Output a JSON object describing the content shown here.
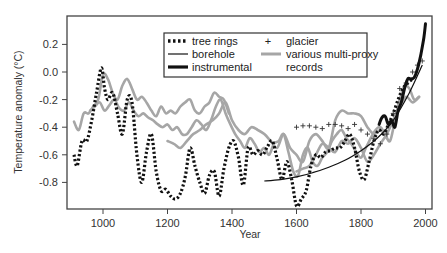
{
  "chart_data": {
    "type": "line",
    "title": "",
    "xlabel": "Year",
    "ylabel": "Temperature anomaly (°C)",
    "xlim": [
      890,
      2025
    ],
    "ylim": [
      -0.98,
      0.38
    ],
    "x_ticks": [
      1000,
      1200,
      1400,
      1600,
      1800,
      2000
    ],
    "x_tick_labels": [
      "1000",
      "1200",
      "1400",
      "1600",
      "1800",
      "2000"
    ],
    "y_ticks": [
      0.2,
      0.0,
      -0.2,
      -0.4,
      -0.6,
      -0.8
    ],
    "y_tick_labels": [
      "0.2",
      "0.0",
      "-0.2",
      "-0.4",
      "-0.6",
      "-0.8"
    ],
    "grid": false,
    "legend_position": "upper center",
    "legend": [
      {
        "label": "tree rings",
        "style": "dotted",
        "color": "#111111"
      },
      {
        "label": "borehole",
        "style": "thin-solid",
        "color": "#111111"
      },
      {
        "label": "instrumental",
        "style": "thick-solid",
        "color": "#111111"
      },
      {
        "label": "glacier",
        "style": "plus-marker",
        "color": "#333333"
      },
      {
        "label": "various multi-proxy records",
        "style": "thick-solid",
        "color": "#a6a6a6"
      }
    ],
    "series": [
      {
        "name": "tree rings",
        "x": [
          910,
          920,
          935,
          950,
          965,
          980,
          995,
          1005,
          1015,
          1030,
          1045,
          1060,
          1075,
          1090,
          1105,
          1120,
          1135,
          1150,
          1165,
          1180,
          1195,
          1210,
          1225,
          1240,
          1255,
          1270,
          1285,
          1300,
          1315,
          1330,
          1345,
          1360,
          1375,
          1390,
          1405,
          1420,
          1435,
          1450,
          1465,
          1480,
          1495,
          1510,
          1525,
          1540,
          1555,
          1570,
          1585,
          1600,
          1615,
          1630,
          1645,
          1660,
          1675,
          1690,
          1705,
          1720,
          1735,
          1750,
          1765,
          1780,
          1795,
          1810,
          1825,
          1840,
          1855,
          1870,
          1885,
          1900,
          1915,
          1930,
          1945,
          1960
        ],
        "y": [
          -0.6,
          -0.68,
          -0.5,
          -0.5,
          -0.35,
          -0.15,
          0.03,
          -0.12,
          -0.2,
          -0.15,
          -0.3,
          -0.45,
          -0.2,
          -0.22,
          -0.6,
          -0.8,
          -0.58,
          -0.45,
          -0.72,
          -0.86,
          -0.85,
          -0.9,
          -0.92,
          -0.88,
          -0.76,
          -0.55,
          -0.68,
          -0.8,
          -0.88,
          -0.75,
          -0.72,
          -0.9,
          -0.7,
          -0.55,
          -0.5,
          -0.62,
          -0.82,
          -0.55,
          -0.6,
          -0.57,
          -0.6,
          -0.54,
          -0.5,
          -0.63,
          -0.78,
          -0.65,
          -0.78,
          -0.97,
          -0.92,
          -0.86,
          -0.68,
          -0.6,
          -0.62,
          -0.58,
          -0.57,
          -0.55,
          -0.55,
          -0.5,
          -0.45,
          -0.55,
          -0.72,
          -0.78,
          -0.65,
          -0.5,
          -0.42,
          -0.45,
          -0.38,
          -0.3,
          -0.2,
          -0.12,
          -0.08,
          -0.05
        ]
      },
      {
        "name": "borehole",
        "x": [
          1500,
          1550,
          1600,
          1650,
          1700,
          1750,
          1800,
          1850,
          1900,
          1950,
          1990
        ],
        "y": [
          -0.79,
          -0.78,
          -0.76,
          -0.73,
          -0.69,
          -0.64,
          -0.57,
          -0.48,
          -0.35,
          -0.15,
          0.05
        ]
      },
      {
        "name": "instrumental",
        "x": [
          1856,
          1865,
          1875,
          1885,
          1895,
          1905,
          1915,
          1925,
          1935,
          1945,
          1955,
          1965,
          1975,
          1985,
          1995,
          2000
        ],
        "y": [
          -0.38,
          -0.33,
          -0.32,
          -0.38,
          -0.35,
          -0.4,
          -0.28,
          -0.22,
          -0.12,
          -0.05,
          -0.05,
          -0.04,
          0.02,
          0.12,
          0.25,
          0.35
        ]
      },
      {
        "name": "glacier",
        "x": [
          1600,
          1620,
          1640,
          1660,
          1680,
          1700,
          1720,
          1740,
          1760,
          1780,
          1800,
          1820,
          1840,
          1860,
          1880,
          1900,
          1920,
          1940,
          1960,
          1975,
          1990
        ],
        "y": [
          -0.4,
          -0.39,
          -0.39,
          -0.4,
          -0.41,
          -0.38,
          -0.38,
          -0.39,
          -0.41,
          -0.38,
          -0.42,
          -0.45,
          -0.48,
          -0.52,
          -0.45,
          -0.3,
          -0.12,
          -0.08,
          0.0,
          0.05,
          0.08
        ]
      },
      {
        "name": "various multi-proxy records (A)",
        "x": [
          910,
          925,
          940,
          955,
          970,
          985,
          1000,
          1015,
          1030,
          1045,
          1060,
          1075,
          1090,
          1105,
          1120,
          1135,
          1150,
          1165,
          1180,
          1195,
          1210,
          1225,
          1240,
          1255,
          1270,
          1285,
          1300,
          1315,
          1330,
          1345,
          1360,
          1375,
          1390
        ],
        "y": [
          -0.36,
          -0.42,
          -0.3,
          -0.3,
          -0.25,
          -0.2,
          -0.02,
          -0.05,
          -0.15,
          -0.2,
          -0.1,
          -0.05,
          -0.12,
          -0.2,
          -0.18,
          -0.22,
          -0.28,
          -0.32,
          -0.25,
          -0.3,
          -0.28,
          -0.3,
          -0.25,
          -0.22,
          -0.2,
          -0.28,
          -0.3,
          -0.25,
          -0.22,
          -0.15,
          -0.18,
          -0.2,
          -0.3
        ]
      },
      {
        "name": "various multi-proxy records (B)",
        "x": [
          960,
          975,
          990,
          1005,
          1020,
          1035,
          1050,
          1065,
          1080,
          1095,
          1110,
          1125,
          1140,
          1155,
          1170,
          1185,
          1200,
          1215,
          1230,
          1245,
          1260,
          1275,
          1290,
          1305,
          1320,
          1335,
          1350,
          1365,
          1380,
          1395,
          1410,
          1425,
          1440,
          1455,
          1470,
          1485,
          1500,
          1515,
          1530,
          1545,
          1560,
          1575,
          1590,
          1605,
          1620,
          1635,
          1650,
          1665,
          1680,
          1695,
          1710,
          1725,
          1740,
          1755,
          1770,
          1785,
          1800,
          1815,
          1830,
          1845,
          1860,
          1875,
          1890,
          1905,
          1920,
          1935,
          1950,
          1965,
          1980
        ],
        "y": [
          -0.28,
          -0.25,
          -0.22,
          -0.28,
          -0.24,
          -0.2,
          -0.26,
          -0.28,
          -0.22,
          -0.28,
          -0.32,
          -0.3,
          -0.33,
          -0.35,
          -0.38,
          -0.4,
          -0.38,
          -0.42,
          -0.4,
          -0.45,
          -0.45,
          -0.4,
          -0.35,
          -0.38,
          -0.42,
          -0.35,
          -0.25,
          -0.2,
          -0.3,
          -0.38,
          -0.45,
          -0.5,
          -0.55,
          -0.48,
          -0.52,
          -0.58,
          -0.55,
          -0.6,
          -0.52,
          -0.5,
          -0.45,
          -0.58,
          -0.72,
          -0.75,
          -0.6,
          -0.55,
          -0.65,
          -0.68,
          -0.62,
          -0.58,
          -0.5,
          -0.45,
          -0.42,
          -0.48,
          -0.52,
          -0.58,
          -0.62,
          -0.55,
          -0.48,
          -0.42,
          -0.4,
          -0.45,
          -0.5,
          -0.35,
          -0.2,
          -0.1,
          -0.12,
          -0.2,
          -0.18
        ]
      },
      {
        "name": "various multi-proxy records (C)",
        "x": [
          1200,
          1220,
          1240,
          1260,
          1280,
          1300,
          1320,
          1340,
          1360,
          1380,
          1400,
          1420,
          1440,
          1460,
          1480,
          1500,
          1520,
          1540,
          1560,
          1580,
          1600,
          1620,
          1640,
          1660,
          1680,
          1700,
          1720,
          1740,
          1760,
          1780,
          1800,
          1820,
          1840,
          1860,
          1880
        ],
        "y": [
          -0.5,
          -0.52,
          -0.55,
          -0.5,
          -0.45,
          -0.42,
          -0.38,
          -0.35,
          -0.3,
          -0.22,
          -0.35,
          -0.42,
          -0.45,
          -0.4,
          -0.42,
          -0.45,
          -0.5,
          -0.55,
          -0.45,
          -0.55,
          -0.6,
          -0.65,
          -0.5,
          -0.45,
          -0.5,
          -0.55,
          -0.35,
          -0.28,
          -0.3,
          -0.3,
          -0.32,
          -0.4,
          -0.45,
          -0.42,
          -0.48
        ]
      },
      {
        "name": "various multi-proxy records (D)",
        "x": [
          1600,
          1620,
          1640,
          1660,
          1680,
          1700,
          1720,
          1740,
          1760,
          1780,
          1800,
          1820,
          1840,
          1860,
          1880,
          1900,
          1920,
          1940,
          1960,
          1980
        ],
        "y": [
          -0.72,
          -0.7,
          -0.68,
          -0.6,
          -0.52,
          -0.55,
          -0.58,
          -0.5,
          -0.52,
          -0.48,
          -0.55,
          -0.65,
          -0.6,
          -0.52,
          -0.45,
          -0.35,
          -0.25,
          -0.18,
          -0.22,
          -0.18
        ]
      }
    ]
  },
  "axes": {
    "xlabel": "Year",
    "ylabel": "Temperature anomaly (°C)"
  },
  "legend": {
    "tree_rings": "tree rings",
    "borehole": "borehole",
    "instrumental": "instrumental",
    "glacier": "glacier",
    "multi_proxy_line1": "various multi-proxy",
    "multi_proxy_line2": "records",
    "glacier_marker": "+"
  },
  "colors": {
    "dark": "#111111",
    "proxy_gray": "#a6a6a6",
    "frame": "#444444",
    "text": "#333333"
  }
}
